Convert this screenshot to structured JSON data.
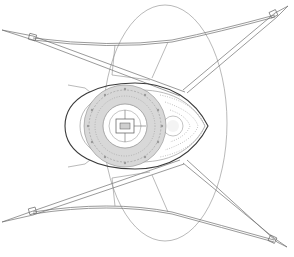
{
  "figure": {
    "type": "line-drawing",
    "colors": {
      "background": "#ffffff",
      "line": "#8a8a8a",
      "outline": "#3a3a3a",
      "hatch": "#d8d8d8"
    },
    "parts": [
      {
        "name": "outer-ellipse",
        "label": ""
      },
      {
        "name": "body-shell",
        "label": ""
      },
      {
        "name": "ring-module",
        "label": ""
      },
      {
        "name": "central-hub",
        "label": ""
      },
      {
        "name": "nose-dome",
        "label": ""
      },
      {
        "name": "leg-upper-left",
        "label": ""
      },
      {
        "name": "leg-upper-right",
        "label": ""
      },
      {
        "name": "leg-lower-left",
        "label": ""
      },
      {
        "name": "leg-lower-right",
        "label": ""
      }
    ]
  }
}
